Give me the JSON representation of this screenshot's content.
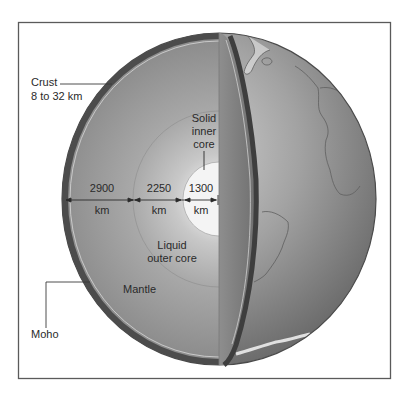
{
  "figure": {
    "colors": {
      "frame": "#555555",
      "crust": "#4a4a4a",
      "mantle": "#8a8a8a",
      "outer_core": "#a6a6a6",
      "inner_core": "#f2f2f2",
      "globe_surface": "#9a9a9a",
      "text": "#2a2a2a"
    },
    "labels": {
      "crust": "Crust",
      "crust_thickness": "8 to 32 km",
      "solid_inner_core_1": "Solid",
      "solid_inner_core_2": "inner",
      "solid_inner_core_3": "core",
      "liquid_outer_core_1": "Liquid",
      "liquid_outer_core_2": "outer core",
      "mantle": "Mantle",
      "moho": "Moho"
    },
    "dimensions": [
      {
        "value": "2900",
        "unit": "km",
        "layer": "mantle"
      },
      {
        "value": "2250",
        "unit": "km",
        "layer": "outer core"
      },
      {
        "value": "1300",
        "unit": "km",
        "layer": "inner core"
      }
    ]
  }
}
